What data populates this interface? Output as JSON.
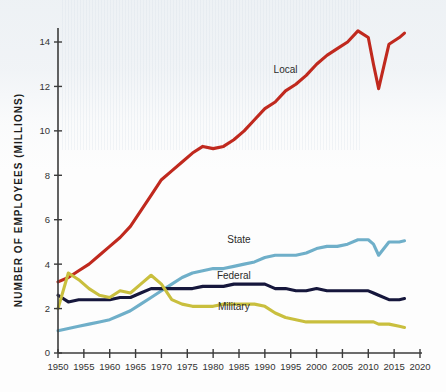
{
  "chart_data": {
    "type": "line",
    "title": "",
    "xlabel": "",
    "ylabel": "NUMBER OF EMPLOYEES (MILLIONS)",
    "xlim": [
      1950,
      2020
    ],
    "ylim": [
      0,
      15
    ],
    "grid": false,
    "legend_position": "inline-labels",
    "x_ticks": [
      1950,
      1955,
      1960,
      1965,
      1970,
      1975,
      1980,
      1985,
      1990,
      1995,
      2000,
      2005,
      2010,
      2015,
      2020
    ],
    "y_ticks": [
      0,
      2,
      4,
      6,
      8,
      10,
      12,
      14
    ],
    "x": [
      1950,
      1952,
      1954,
      1956,
      1958,
      1960,
      1962,
      1964,
      1966,
      1968,
      1970,
      1972,
      1974,
      1976,
      1978,
      1980,
      1982,
      1984,
      1986,
      1988,
      1990,
      1992,
      1994,
      1996,
      1998,
      2000,
      2002,
      2004,
      2006,
      2008,
      2010,
      2011,
      2012,
      2014,
      2016,
      2017
    ],
    "series": [
      {
        "name": "Local",
        "color": "#C0291E",
        "label_x": 1994,
        "label_y": 12.6,
        "values": [
          3.2,
          3.4,
          3.7,
          4.0,
          4.4,
          4.8,
          5.2,
          5.7,
          6.4,
          7.1,
          7.8,
          8.2,
          8.6,
          9.0,
          9.3,
          9.2,
          9.3,
          9.6,
          10.0,
          10.5,
          11.0,
          11.3,
          11.8,
          12.1,
          12.5,
          13.0,
          13.4,
          13.7,
          14.0,
          14.5,
          14.2,
          13.0,
          11.9,
          13.9,
          14.2,
          14.4
        ]
      },
      {
        "name": "State",
        "color": "#6FAFC9",
        "label_x": 1985,
        "label_y": 4.95,
        "values": [
          1.0,
          1.1,
          1.2,
          1.3,
          1.4,
          1.5,
          1.7,
          1.9,
          2.2,
          2.5,
          2.8,
          3.1,
          3.4,
          3.6,
          3.7,
          3.8,
          3.8,
          3.9,
          4.0,
          4.1,
          4.3,
          4.4,
          4.4,
          4.4,
          4.5,
          4.7,
          4.8,
          4.8,
          4.9,
          5.1,
          5.1,
          4.9,
          4.4,
          5.0,
          5.0,
          5.05
        ]
      },
      {
        "name": "Federal",
        "color": "#16173C",
        "label_x": 1984,
        "label_y": 3.35,
        "values": [
          2.6,
          2.3,
          2.4,
          2.4,
          2.4,
          2.4,
          2.5,
          2.5,
          2.7,
          2.9,
          2.9,
          2.9,
          2.9,
          2.9,
          3.0,
          3.0,
          3.0,
          3.1,
          3.1,
          3.1,
          3.1,
          2.9,
          2.9,
          2.8,
          2.8,
          2.9,
          2.8,
          2.8,
          2.8,
          2.8,
          2.8,
          2.7,
          2.6,
          2.4,
          2.4,
          2.45
        ]
      },
      {
        "name": "Military",
        "color": "#C9BF3E",
        "label_x": 1984,
        "label_y": 1.95,
        "values": [
          2.0,
          3.6,
          3.3,
          2.9,
          2.6,
          2.5,
          2.8,
          2.7,
          3.1,
          3.5,
          3.1,
          2.4,
          2.2,
          2.1,
          2.1,
          2.1,
          2.2,
          2.2,
          2.2,
          2.2,
          2.1,
          1.8,
          1.6,
          1.5,
          1.4,
          1.4,
          1.4,
          1.4,
          1.4,
          1.4,
          1.4,
          1.4,
          1.3,
          1.3,
          1.2,
          1.15
        ]
      }
    ]
  },
  "axis": {
    "y_title": "NUMBER OF EMPLOYEES (MILLIONS)"
  }
}
